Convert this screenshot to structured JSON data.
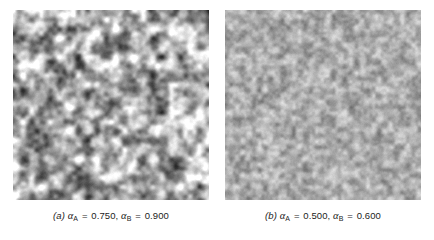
{
  "figure": {
    "background_color": "#ffffff",
    "width": 434,
    "height": 240,
    "type": "two-panel grayscale noise texture figure"
  },
  "panels": [
    {
      "id": "a",
      "index_label": "(a)",
      "caption_text": "(a) αA = 0.750, αB = 0.900",
      "alpha_a_symbol": "α",
      "alpha_a_subscript": "A",
      "alpha_a_value": "0.750",
      "alpha_b_symbol": "α",
      "alpha_b_subscript": "B",
      "alpha_b_value": "0.900",
      "equals": "=",
      "comma": ",",
      "texture": {
        "kind": "correlated-grayscale-noise",
        "grain_scale": 3.1,
        "contrast": 1.0,
        "blur": 1.15,
        "seed": 20250401,
        "mean_gray": 168,
        "std_gray": 46,
        "min_gray": 10,
        "max_gray": 255
      }
    },
    {
      "id": "b",
      "index_label": "(b)",
      "caption_text": "(b) αA = 0.500, αB = 0.600",
      "alpha_a_symbol": "α",
      "alpha_a_subscript": "A",
      "alpha_a_value": "0.500",
      "alpha_b_symbol": "α",
      "alpha_b_subscript": "B",
      "alpha_b_value": "0.600",
      "equals": "=",
      "comma": ",",
      "texture": {
        "kind": "correlated-grayscale-noise",
        "grain_scale": 1.9,
        "contrast": 0.62,
        "blur": 0.8,
        "seed": 77310912,
        "mean_gray": 172,
        "std_gray": 30,
        "min_gray": 48,
        "max_gray": 252
      }
    }
  ],
  "chart_data": {
    "type": "heatmap",
    "title": "",
    "xlabel": "",
    "ylabel": "",
    "panel_count": 2,
    "colormap": "grayscale",
    "legend_position": "none",
    "grid": false,
    "series": [
      {
        "name": "(a) αA = 0.750, αB = 0.900",
        "alpha_A": 0.75,
        "alpha_B": 0.9,
        "image_size_px": [
          196,
          190
        ],
        "mean_gray": 168,
        "std_gray": 46
      },
      {
        "name": "(b) αA = 0.500, αB = 0.600",
        "alpha_A": 0.5,
        "alpha_B": 0.6,
        "image_size_px": [
          196,
          190
        ],
        "mean_gray": 172,
        "std_gray": 30
      }
    ]
  }
}
